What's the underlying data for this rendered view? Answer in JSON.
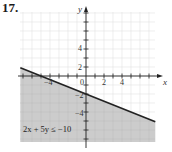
{
  "problem": {
    "number": "17."
  },
  "chart_data": {
    "type": "line",
    "title": "",
    "xlabel": "x",
    "ylabel": "y",
    "xlim": [
      -7.3,
      7.7
    ],
    "ylim": [
      -7,
      7.5
    ],
    "grid": true,
    "x_tick_labels": [
      "-4",
      "0",
      "2",
      "4"
    ],
    "x_tick_values": [
      -4,
      0,
      2,
      4
    ],
    "y_tick_labels": [
      "4",
      "2",
      "-2",
      "-4"
    ],
    "y_tick_values": [
      4,
      2,
      -2,
      -4
    ],
    "series": [
      {
        "name": "2x + 5y = -10",
        "style": "solid boundary line",
        "x": [
          -7.3,
          -5,
          0,
          7.7
        ],
        "y": [
          0.92,
          0,
          -2,
          -5.08
        ]
      }
    ],
    "shaded_region": "below the line",
    "annotations": [
      {
        "text": "2x + 5y ≤ −10",
        "position": "lower-left, inside shaded region"
      }
    ],
    "colors": {
      "shade": "#c9c9c9",
      "line": "#222222",
      "grid": "#e3e3e3",
      "axis": "#222222"
    }
  },
  "labels": {
    "x_axis": "x",
    "y_axis": "y",
    "x_ticks": [
      "−4",
      "0",
      "2",
      "4"
    ],
    "y_ticks": [
      "4",
      "2",
      "−2",
      "−4"
    ],
    "inequality": "2x + 5y ≤ −10"
  }
}
